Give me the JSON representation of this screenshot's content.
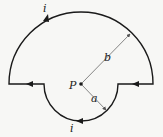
{
  "diagram": {
    "type": "current-loop",
    "labels": {
      "current_top": "i",
      "current_bottom": "i",
      "point": "P",
      "outer_radius": "b",
      "inner_radius": "a"
    },
    "colors": {
      "wire": "#1a1a1a",
      "dimension_line": "#555555",
      "background": "#f7f7f5"
    }
  }
}
